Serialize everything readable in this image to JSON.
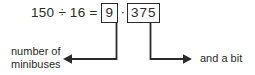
{
  "figure": {
    "type": "annotated-equation-diagram",
    "background_color": "#ffffff",
    "ink_color": "#2b2b2b"
  },
  "equation": {
    "dividend": "150",
    "division_sign": "÷",
    "divisor": "16",
    "equals_sign": "=",
    "boxed_integer_part": "9",
    "decimal_point": "·",
    "boxed_fractional_part": "375"
  },
  "annotations": {
    "left": {
      "line1": "number of",
      "line2": "minibuses",
      "arrow_direction": "left",
      "points_to": "boxed_integer_part"
    },
    "right": {
      "text": "and a bit",
      "arrow_direction": "right",
      "points_to": "boxed_fractional_part"
    }
  }
}
